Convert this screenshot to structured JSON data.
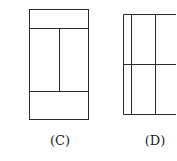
{
  "figures": [
    {
      "id": "C",
      "label": "(C)"
    },
    {
      "id": "D",
      "label": "(D)"
    }
  ],
  "colors": {
    "stroke": "#2a2a2a",
    "background": "#ffffff"
  }
}
